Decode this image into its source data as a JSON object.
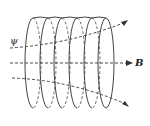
{
  "figure": {
    "labels": {
      "flux": "ψ",
      "field": "B"
    },
    "coil": {
      "turns": 6,
      "color": "#444444"
    },
    "line_color": "#333333"
  }
}
